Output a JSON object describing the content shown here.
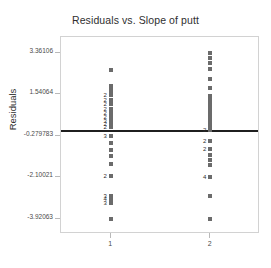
{
  "chart_data": {
    "type": "scatter",
    "title": "Residuals vs. Slope of putt",
    "xlabel": "",
    "ylabel": "Residuals",
    "grid": false,
    "legend": null,
    "xlim": [
      0.5,
      2.5
    ],
    "ylim": [
      -4.6,
      4.05
    ],
    "xticks": [
      "1",
      "2"
    ],
    "xtick_values": [
      1,
      2
    ],
    "yticks": [
      "3.36106",
      "1.54064",
      "-0.279783",
      "-2.10021",
      "-3.92063"
    ],
    "ytick_values": [
      3.36106,
      1.54064,
      -0.279783,
      -2.10021,
      -3.92063
    ],
    "reference_line": {
      "orientation": "horizontal",
      "y": -0.05,
      "color": "#1f1f1f"
    },
    "marker_color": "#6b6b6b",
    "frame_color": "#d2d2d2",
    "series": [
      {
        "name": "Slope 1",
        "x": 1,
        "points": [
          {
            "y": 2.62,
            "count": 1
          },
          {
            "y": 1.92,
            "count": 1
          },
          {
            "y": 1.82,
            "count": 1
          },
          {
            "y": 1.72,
            "count": 1
          },
          {
            "y": 1.62,
            "count": 1
          },
          {
            "y": 1.5,
            "count": 2
          },
          {
            "y": 1.3,
            "count": 2
          },
          {
            "y": 1.1,
            "count": 2
          },
          {
            "y": 0.9,
            "count": 2
          },
          {
            "y": 0.7,
            "count": 2
          },
          {
            "y": 0.52,
            "count": 2
          },
          {
            "y": 0.36,
            "count": 3
          },
          {
            "y": 0.22,
            "count": 2
          },
          {
            "y": 0.08,
            "count": 2
          },
          {
            "y": -0.28,
            "count": 3
          },
          {
            "y": -0.62,
            "count": 1
          },
          {
            "y": -0.92,
            "count": 1
          },
          {
            "y": -1.18,
            "count": 1
          },
          {
            "y": -1.52,
            "count": 1
          },
          {
            "y": -2.06,
            "count": 2
          },
          {
            "y": -2.92,
            "count": 3
          },
          {
            "y": -3.08,
            "count": 4
          },
          {
            "y": -3.22,
            "count": 3
          },
          {
            "y": -3.92,
            "count": 1
          }
        ]
      },
      {
        "name": "Slope 2",
        "x": 2,
        "points": [
          {
            "y": 3.36,
            "count": 1
          },
          {
            "y": 3.12,
            "count": 1
          },
          {
            "y": 2.9,
            "count": 1
          },
          {
            "y": 2.66,
            "count": 1
          },
          {
            "y": 2.2,
            "count": 1
          },
          {
            "y": 1.82,
            "count": 1
          },
          {
            "y": 1.46,
            "count": 1
          },
          {
            "y": 1.28,
            "count": 1
          },
          {
            "y": 1.12,
            "count": 1
          },
          {
            "y": 0.96,
            "count": 1
          },
          {
            "y": 0.8,
            "count": 1
          },
          {
            "y": 0.64,
            "count": 1
          },
          {
            "y": 0.48,
            "count": 1
          },
          {
            "y": 0.32,
            "count": 1
          },
          {
            "y": 0.16,
            "count": 1
          },
          {
            "y": -0.05,
            "count": 2
          },
          {
            "y": -0.52,
            "count": 2
          },
          {
            "y": -0.86,
            "count": 2
          },
          {
            "y": -1.12,
            "count": 1
          },
          {
            "y": -1.34,
            "count": 1
          },
          {
            "y": -1.56,
            "count": 1
          },
          {
            "y": -2.08,
            "count": 4
          },
          {
            "y": -2.92,
            "count": 1
          },
          {
            "y": -3.92,
            "count": 1
          }
        ]
      }
    ]
  }
}
